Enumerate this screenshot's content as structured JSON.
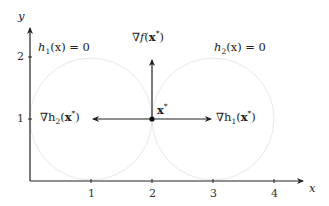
{
  "axes": {
    "x_label": "x",
    "y_label": "y",
    "x_ticks": [
      "1",
      "2",
      "3",
      "4"
    ],
    "y_ticks": [
      "1",
      "2"
    ]
  },
  "constraints": {
    "h1": {
      "name": "h",
      "sub": "1",
      "arg": "(x) = 0",
      "center": [
        1,
        1
      ],
      "radius": 1
    },
    "h2": {
      "name": "h",
      "sub": "2",
      "arg": "(x) = 0",
      "center": [
        3,
        1
      ],
      "radius": 1
    }
  },
  "point": {
    "label": "x",
    "sup": "*",
    "coords": [
      2,
      1
    ]
  },
  "vectors": {
    "grad_f": {
      "prefix": "∇",
      "name": "f",
      "arg_open": "(",
      "arg": "x",
      "sup": "*",
      "arg_close": ")",
      "direction": [
        0,
        1
      ]
    },
    "grad_h1": {
      "prefix": "∇h",
      "sub": "1",
      "arg_open": "(",
      "arg": "x",
      "sup": "*",
      "arg_close": ")",
      "direction": [
        1,
        0
      ]
    },
    "grad_h2": {
      "prefix": "∇h",
      "sub": "2",
      "arg_open": "(",
      "arg": "x",
      "sup": "*",
      "arg_close": ")",
      "direction": [
        -1,
        0
      ]
    }
  },
  "colors": {
    "axis": "#222222",
    "circle": "#e6e6e6",
    "arrow": "#222222"
  }
}
